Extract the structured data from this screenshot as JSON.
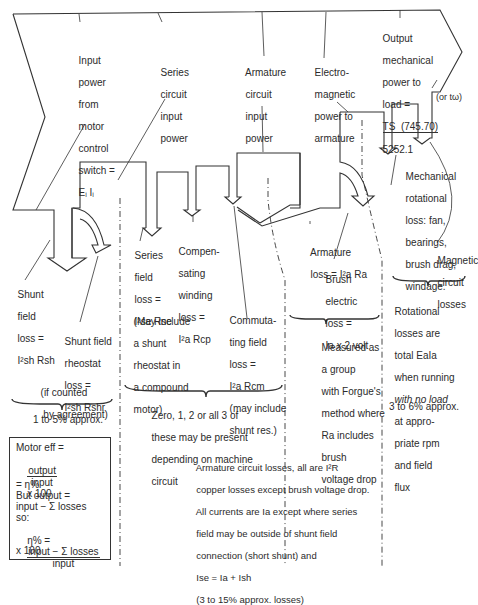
{
  "flow_labels": {
    "input_power": [
      "Input",
      "power",
      "from",
      "motor",
      "control",
      "switch =",
      "Eᵢ Iᵢ"
    ],
    "series_circuit_input": [
      "Series",
      "circuit",
      "input",
      "power"
    ],
    "armature_circuit_input": [
      "Armature",
      "circuit",
      "input",
      "power"
    ],
    "electromagnetic_power": [
      "Electro-",
      "magnetic",
      "power to",
      "armature"
    ],
    "output_power": {
      "lines": [
        "Output",
        "mechanical",
        "power to",
        "load ="
      ],
      "formula_numerator": "TS  (745.70)",
      "formula_denominator": "5252.1",
      "alt": "(or tω)"
    }
  },
  "losses": {
    "shunt_field": {
      "lines": [
        "Shunt",
        "field",
        "loss ="
      ],
      "formula": "I²sh Rsh"
    },
    "shunt_rheostat": {
      "lines": [
        "Shunt field",
        "rheostat",
        "loss ="
      ],
      "formula": "I²sh Rshr",
      "note": [
        "(if counted",
        " by agreement)"
      ]
    },
    "series_field": {
      "lines": [
        "Series",
        "field",
        "loss ="
      ],
      "formula": "I²se Rse"
    },
    "compensating": {
      "lines": [
        "Compen-",
        "sating",
        "winding",
        "loss ="
      ],
      "formula": "I²a Rcp"
    },
    "series_note": [
      "(May include",
      "a shunt",
      "rheostat in",
      "a compound",
      "motor)"
    ],
    "commutating": {
      "lines": [
        "Commuta-",
        "ting field",
        "loss ="
      ],
      "formula": "I²a Rcm",
      "note": [
        "(may include",
        "shunt res.)"
      ]
    },
    "armature": {
      "lines": [
        "Armature",
        "loss = I²a Ra"
      ]
    },
    "brush": {
      "lines": [
        "Brush",
        "electric",
        "loss =",
        "Ia x 2 volt"
      ]
    },
    "mechanical": [
      "Mechanical",
      "rotational",
      "loss: fan,",
      "bearings,",
      "brush drag,",
      "windage."
    ],
    "magnetic": [
      "Magnetic",
      "circuit",
      "losses"
    ]
  },
  "group_notes": {
    "shunt_percent": "1 to 5% approx.",
    "interpoles": [
      "Zero, 1, 2 or all 3 of",
      "these may be present",
      "depending on machine",
      "circuit"
    ],
    "forgue": [
      "Measured as",
      "a group",
      "with Forgue's",
      "method where",
      "Ra includes",
      "brush",
      "voltage drop"
    ],
    "rotational": [
      "Rotational",
      "losses are",
      "total EaIa",
      "when running",
      "with no load",
      "at appro-",
      "priate rpm",
      "and field",
      "flux"
    ],
    "rotational_percent": "3 to 6% approx.",
    "armature_circuit": [
      "Armature circuit losses, all are I²R",
      "copper losses except brush voltage drop.",
      "All currents are Ia except where series",
      "field may be outside of shunt field",
      "connection (short shunt) and",
      "Ise = Ia + Ish",
      "(3 to 15% approx. losses)"
    ]
  },
  "efficiency_box": {
    "line1": "Motor eff =",
    "frac1_num": "output",
    "frac1_den": "input",
    "times100": "x 100",
    "eta": "= η%",
    "but": "But output =",
    "minus": "input − Σ losses",
    "so": "so:",
    "eta_lhs": "η% =",
    "frac2_num": "input − Σ losses",
    "frac2_den": "input",
    "times100b": "x 100"
  },
  "colors": {
    "line": "#333333",
    "text": "#2b2b2b",
    "background": "#ffffff"
  }
}
